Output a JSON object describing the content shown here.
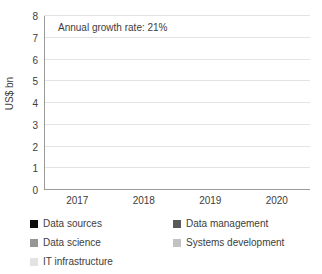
{
  "chart_data": {
    "type": "bar",
    "stacked": true,
    "title": "",
    "subtitle": "",
    "xlabel": "",
    "ylabel": "US$ bn",
    "categories": [
      "2017",
      "2018",
      "2019",
      "2020"
    ],
    "ylim": [
      0,
      8
    ],
    "yticks": [
      0,
      1,
      2,
      3,
      4,
      5,
      6,
      7,
      8
    ],
    "ytick_labels": [
      "0",
      "1",
      "2",
      "3",
      "4",
      "5",
      "6",
      "7",
      "8"
    ],
    "grid": true,
    "legend_position": "bottom",
    "annotations": [
      {
        "text": "Annual growth rate: 21%",
        "x": "2017",
        "y": 7.4
      }
    ],
    "series": [
      {
        "name": "Data sources",
        "color": "#0d0d0d",
        "values": [
          1.1,
          1.35,
          1.65,
          2.1
        ]
      },
      {
        "name": "Data management",
        "color": "#595959",
        "values": [
          0.8,
          0.95,
          1.2,
          1.45
        ]
      },
      {
        "name": "Data science",
        "color": "#969696",
        "values": [
          1.0,
          1.25,
          1.4,
          1.65
        ]
      },
      {
        "name": "Systems development",
        "color": "#c2c2c2",
        "values": [
          0.9,
          1.0,
          1.2,
          1.45
        ]
      },
      {
        "name": "IT infrastructure",
        "color": "#e3e3e3",
        "values": [
          0.45,
          0.55,
          0.75,
          0.85
        ]
      }
    ],
    "totals": [
      4.25,
      5.1,
      6.2,
      7.5
    ]
  },
  "legend": {
    "items": [
      {
        "label": "Data sources",
        "color": "#0d0d0d"
      },
      {
        "label": "Data management",
        "color": "#595959"
      },
      {
        "label": "Data science",
        "color": "#969696"
      },
      {
        "label": "Systems development",
        "color": "#c2c2c2"
      },
      {
        "label": "IT infrastructure",
        "color": "#e3e3e3"
      }
    ]
  },
  "colors": {
    "background": "#ffffff",
    "text": "#3d3d3d",
    "gridline": "#e3e3e3",
    "axis": "#9a9a9a"
  }
}
